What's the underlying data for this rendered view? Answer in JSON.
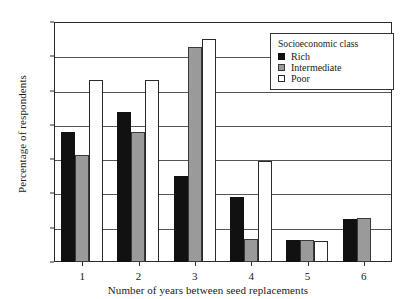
{
  "chart_data": {
    "type": "bar",
    "title": "",
    "xlabel": "Number of years between seed replacements",
    "ylabel": "Percentage of respondents",
    "categories": [
      "1",
      "2",
      "3",
      "4",
      "5",
      "6"
    ],
    "ylim": [
      0,
      35
    ],
    "yticks": [
      0,
      5,
      10,
      15,
      20,
      25,
      30,
      35
    ],
    "grid": true,
    "legend_position": "top-right",
    "legend_title": "Socioeconomic class",
    "series": [
      {
        "name": "Rich",
        "color": "#111111",
        "values": [
          19.0,
          21.9,
          12.6,
          9.5,
          3.2,
          6.3
        ]
      },
      {
        "name": "Intermediate",
        "color": "#9a9a9a",
        "values": [
          15.6,
          18.9,
          31.4,
          3.3,
          3.2,
          6.4
        ]
      },
      {
        "name": "Poor",
        "color": "#ffffff",
        "values": [
          26.5,
          26.6,
          32.5,
          14.8,
          3.0,
          null
        ]
      }
    ]
  },
  "axes": {
    "y_title": "Percentage of respondents",
    "x_title": "Number of years between seed replacements",
    "y_tick_labels": [
      "0",
      "5",
      "10",
      "15",
      "20",
      "25",
      "30",
      "35"
    ],
    "x_tick_labels": [
      "1",
      "2",
      "3",
      "4",
      "5",
      "6"
    ]
  },
  "legend": {
    "title": "Socioeconomic class",
    "entries": [
      {
        "label": "Rich",
        "swatch": "rich"
      },
      {
        "label": "Intermediate",
        "swatch": "inter"
      },
      {
        "label": "Poor",
        "swatch": "poor"
      }
    ]
  }
}
